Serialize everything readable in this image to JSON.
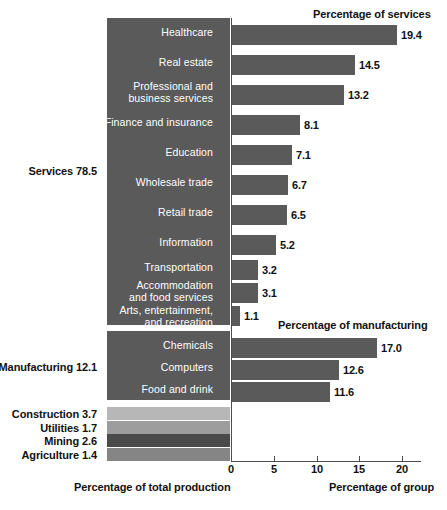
{
  "chart_data": {
    "type": "bar",
    "title": "",
    "orientation": "horizontal",
    "xlabel": "Percentage of group",
    "ylabel": "",
    "xlim": [
      0,
      22
    ],
    "xticks": [
      0,
      5,
      10,
      15,
      20
    ],
    "grid": false,
    "legend": false,
    "left_axis_caption": "Percentage of total production",
    "right_axis_caption": "Percentage of group",
    "section_headers": {
      "services": "Percentage of services",
      "manufacturing": "Percentage of manufacturing"
    },
    "groups": [
      {
        "name": "Services",
        "total_label": "Services 78.5",
        "total": 78.5,
        "header": "Percentage of services",
        "categories": [
          "Healthcare",
          "Real estate",
          "Professional and business services",
          "Finance and insurance",
          "Education",
          "Wholesale trade",
          "Retail trade",
          "Information",
          "Transportation",
          "Accommodation and food services",
          "Arts, entertainment, and recreation"
        ],
        "values": [
          19.4,
          14.5,
          13.2,
          8.1,
          7.1,
          6.7,
          6.5,
          5.2,
          3.2,
          3.1,
          1.1
        ]
      },
      {
        "name": "Manufacturing",
        "total_label": "Manufacturing 12.1",
        "total": 12.1,
        "header": "Percentage of manufacturing",
        "categories": [
          "Chemicals",
          "Computers",
          "Food and drink"
        ],
        "values": [
          17.0,
          12.6,
          11.6
        ]
      }
    ],
    "single_rows": [
      {
        "label": "Construction 3.7",
        "name": "Construction",
        "value": 3.7,
        "color": "#b7b7b7"
      },
      {
        "label": "Utilities 1.7",
        "name": "Utilities",
        "value": 1.7,
        "color": "#9d9d9d"
      },
      {
        "label": "Mining 2.6",
        "name": "Mining",
        "value": 2.6,
        "color": "#4a4a4a"
      },
      {
        "label": "Agriculture 1.4",
        "name": "Agriculture",
        "value": 1.4,
        "color": "#858585"
      }
    ],
    "colors": {
      "bar": "#5a5a5a",
      "panel": "#5a5a5a",
      "axis": "#4d4d4d",
      "text": "#111111",
      "label_on_panel": "#ffffff",
      "background": "#ffffff"
    }
  },
  "rows": {
    "services": [
      {
        "label": "Healthcare",
        "value": "19.4",
        "num": 19.4,
        "label_top": 27,
        "label_lines": 1,
        "bar_top": 25
      },
      {
        "label": "Real estate",
        "value": "14.5",
        "num": 14.5,
        "label_top": 57,
        "label_lines": 1,
        "bar_top": 55
      },
      {
        "label": "Professional and\nbusiness services",
        "value": "13.2",
        "num": 13.2,
        "label_top": 81,
        "label_lines": 2,
        "bar_top": 85
      },
      {
        "label": "Finance and insurance",
        "value": "8.1",
        "num": 8.1,
        "label_top": 117,
        "label_lines": 1,
        "bar_top": 115
      },
      {
        "label": "Education",
        "value": "7.1",
        "num": 7.1,
        "label_top": 147,
        "label_lines": 1,
        "bar_top": 145
      },
      {
        "label": "Wholesale trade",
        "value": "6.7",
        "num": 6.7,
        "label_top": 177,
        "label_lines": 1,
        "bar_top": 175
      },
      {
        "label": "Retail trade",
        "value": "6.5",
        "num": 6.5,
        "label_top": 207,
        "label_lines": 1,
        "bar_top": 205
      },
      {
        "label": "Information",
        "value": "5.2",
        "num": 5.2,
        "label_top": 237,
        "label_lines": 1,
        "bar_top": 235
      },
      {
        "label": "Transportation",
        "value": "3.2",
        "num": 3.2,
        "label_top": 262,
        "label_lines": 1,
        "bar_top": 260
      },
      {
        "label": "Accommodation\nand food services",
        "value": "3.1",
        "num": 3.1,
        "label_top": 280,
        "label_lines": 2,
        "bar_top": 283
      },
      {
        "label": "Arts, entertainment,\nand recreation",
        "value": "1.1",
        "num": 1.1,
        "label_top": 305,
        "label_lines": 2,
        "bar_top": 306
      }
    ],
    "manufacturing": [
      {
        "label": "Chemicals",
        "value": "17.0",
        "num": 17.0,
        "label_top": 340,
        "label_lines": 1,
        "bar_top": 338
      },
      {
        "label": "Computers",
        "value": "12.6",
        "num": 12.6,
        "label_top": 362,
        "label_lines": 1,
        "bar_top": 360
      },
      {
        "label": "Food and drink",
        "value": "11.6",
        "num": 11.6,
        "label_top": 384,
        "label_lines": 1,
        "bar_top": 382
      }
    ]
  },
  "axis": {
    "ticks": [
      {
        "label": "0",
        "value": 0
      },
      {
        "label": "5",
        "value": 5
      },
      {
        "label": "10",
        "value": 10
      },
      {
        "label": "15",
        "value": 15
      },
      {
        "label": "20",
        "value": 20
      }
    ]
  }
}
